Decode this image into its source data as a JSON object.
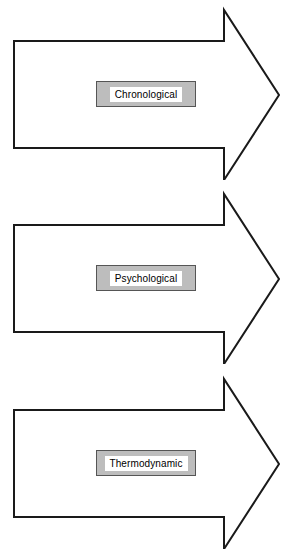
{
  "diagram": {
    "type": "block-arrow-stack",
    "orientation": "horizontal-right",
    "background_color": "#ffffff",
    "arrow_outline_color": "#1a1a1a",
    "arrow_fill_color": "#ffffff",
    "label_box_fill_color": "#bdbdbd",
    "label_box_border_color": "#555555",
    "label_text_background_color": "#ffffff",
    "label_text_color": "#000000",
    "arrows": [
      {
        "id": "arrow-1",
        "label": "Chronological",
        "order": 1
      },
      {
        "id": "arrow-2",
        "label": "Psychological",
        "order": 2
      },
      {
        "id": "arrow-3",
        "label": "Thermodynamic",
        "order": 3
      }
    ]
  }
}
